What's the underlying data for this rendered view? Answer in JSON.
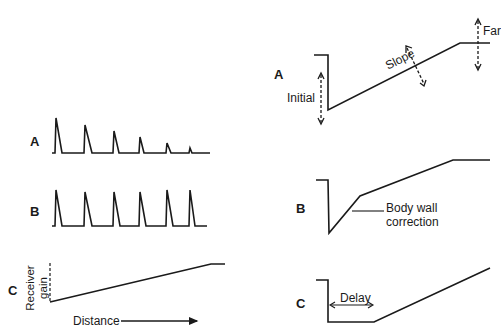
{
  "left_panel": {
    "labels": {
      "a": "A",
      "b": "B",
      "c": "C"
    },
    "axis_y": "Receiver gain",
    "axis_y_line1": "Receiver",
    "axis_y_line2": "gain",
    "axis_x": "Distance"
  },
  "right_panel": {
    "labels": {
      "a": "A",
      "b": "B",
      "c": "C"
    },
    "initial": "Initial",
    "slope": "Slope",
    "far": "Far",
    "body_wall_1": "Body wall",
    "body_wall_2": "correction",
    "delay": "Delay"
  },
  "colors": {
    "line": "#1a1a1a",
    "background": "#ffffff"
  }
}
